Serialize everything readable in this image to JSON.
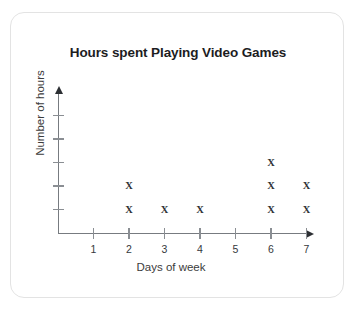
{
  "card": {
    "background": "#ffffff",
    "border_color": "#e3e3e3"
  },
  "chart_data": {
    "type": "scatter",
    "plot_style": "dot-plot-x-marks",
    "title": "Hours spent Playing Video Games",
    "xlabel": "Days of week",
    "ylabel": "Number of hours",
    "categories": [
      "1",
      "2",
      "3",
      "4",
      "5",
      "6",
      "7"
    ],
    "x": [
      1,
      2,
      3,
      4,
      5,
      6,
      7
    ],
    "values": [
      0,
      2,
      1,
      1,
      0,
      3,
      2
    ],
    "marker": "X",
    "marker_color": "#2f3236",
    "xlim": [
      0,
      7.6
    ],
    "ylim": [
      0,
      5
    ],
    "y_tick_values": [
      1,
      2,
      3,
      4,
      5
    ],
    "y_tick_labels": [
      "",
      "",
      "",
      "",
      ""
    ],
    "x_tick_labels": [
      "1",
      "2",
      "3",
      "4",
      "5",
      "6",
      "7"
    ],
    "grid": false,
    "legend": false,
    "axis_color": "#777b80",
    "axis_arrows": true,
    "points": [
      {
        "day": "2",
        "stack": 1
      },
      {
        "day": "2",
        "stack": 2
      },
      {
        "day": "3",
        "stack": 1
      },
      {
        "day": "4",
        "stack": 1
      },
      {
        "day": "6",
        "stack": 1
      },
      {
        "day": "6",
        "stack": 2
      },
      {
        "day": "6",
        "stack": 3
      },
      {
        "day": "7",
        "stack": 1
      },
      {
        "day": "7",
        "stack": 2
      }
    ]
  }
}
